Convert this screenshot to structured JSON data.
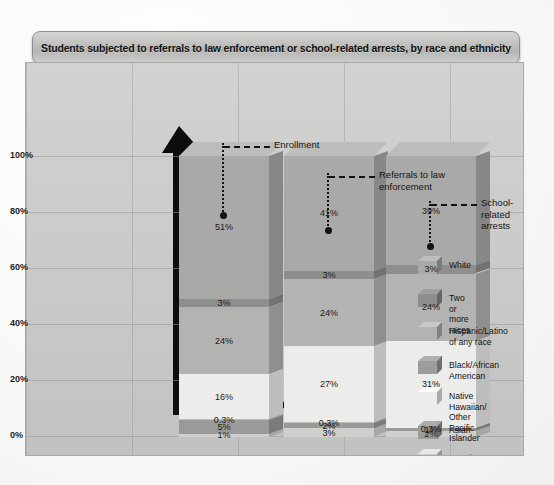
{
  "title": "Students subjected to referrals to law enforcement or school-related arrests, by race and ethnicity",
  "axis": {
    "yticks": [
      "100%",
      "80%",
      "60%",
      "40%",
      "20%",
      "0%"
    ]
  },
  "callouts": [
    {
      "label": "Enrollment"
    },
    {
      "label": "Referrals to law\nenforcement"
    },
    {
      "label": "School-related\narrests"
    }
  ],
  "legend": [
    {
      "label": "White",
      "color": "#a9a9a7"
    },
    {
      "label": "Two or more races",
      "color": "#8e8e8c"
    },
    {
      "label": "Hispanic/Latino\nof any race",
      "color": "#b3b3b1"
    },
    {
      "label": "Black/African\nAmerican",
      "color": "#9c9c9a"
    },
    {
      "label": "Native Hawaiian/\nOther Pacific Islander",
      "color": "#ececea"
    },
    {
      "label": "Asian",
      "color": "#9a9a98"
    },
    {
      "label": "American Indian/\nAlaska Native",
      "color": "#cfcfcd"
    }
  ],
  "chart_data": {
    "type": "bar",
    "subtype": "100% stacked 3D column",
    "title": "Students subjected to referrals to law enforcement or school-related arrests, by race and ethnicity",
    "xlabel": "",
    "ylabel": "",
    "ylim": [
      0,
      100
    ],
    "ytick_values": [
      0,
      20,
      40,
      60,
      80,
      100
    ],
    "ytick_labels": [
      "0%",
      "20%",
      "40%",
      "60%",
      "80%",
      "100%"
    ],
    "grid": true,
    "legend_position": "right",
    "categories": [
      "Enrollment",
      "Referrals to law enforcement",
      "School-related arrests"
    ],
    "series": [
      {
        "name": "White",
        "color": "#a9a9a7",
        "values": [
          51,
          41,
          39
        ],
        "labels": [
          "51%",
          "41%",
          "39%"
        ]
      },
      {
        "name": "Two or more races",
        "color": "#8e8e8c",
        "values": [
          3,
          3,
          3
        ],
        "labels": [
          "3%",
          "3%",
          "3%"
        ]
      },
      {
        "name": "Hispanic/Latino of any race",
        "color": "#b3b3b1",
        "values": [
          24,
          24,
          24
        ],
        "labels": [
          "24%",
          "24%",
          "24%"
        ]
      },
      {
        "name": "Black/African American",
        "color": "#ececea",
        "values": [
          16,
          27,
          31
        ],
        "labels": [
          "16%",
          "27%",
          "31%"
        ]
      },
      {
        "name": "Native Hawaiian/Other Pacific Islander",
        "color": "#bebebc",
        "values": [
          0.3,
          0.3,
          0.3
        ],
        "labels": [
          "0.3%",
          "0.3%",
          "0.3%"
        ]
      },
      {
        "name": "Asian",
        "color": "#9a9a98",
        "values": [
          5,
          2,
          1
        ],
        "labels": [
          "5%",
          "2%",
          "1%"
        ]
      },
      {
        "name": "American Indian/Alaska Native",
        "color": "#cfcfcd",
        "values": [
          1,
          3,
          2
        ],
        "labels": [
          "1%",
          "3%",
          "2%"
        ]
      }
    ]
  }
}
